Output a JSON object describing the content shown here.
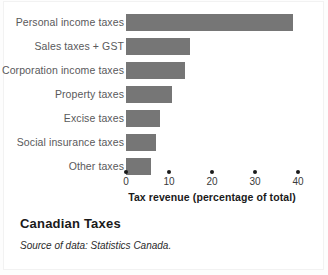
{
  "chart_data": {
    "type": "bar",
    "orientation": "horizontal",
    "title": "Canadian Taxes",
    "source_note": "Source of data: Statistics Canada.",
    "xlabel": "Tax revenue (percentage of total)",
    "ylabel": "",
    "xlim": [
      0,
      40
    ],
    "xticks": [
      0,
      10,
      20,
      30,
      40
    ],
    "xticklabels": [
      "0",
      "10",
      "20",
      "30",
      "40"
    ],
    "grid": false,
    "legend": false,
    "bar_color": "#767676",
    "categories": [
      "Personal income taxes",
      "Sales taxes + GST",
      "Corporation income taxes",
      "Property taxes",
      "Excise taxes",
      "Social insurance taxes",
      "Other taxes"
    ],
    "values": [
      38.8,
      14.9,
      13.7,
      10.7,
      7.9,
      7.0,
      5.8
    ]
  },
  "figure": {
    "title": "Canadian Taxes",
    "source": "Source of data: Statistics Canada."
  }
}
